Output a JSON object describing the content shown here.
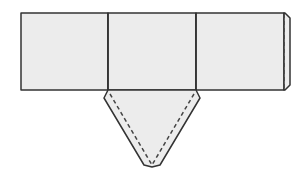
{
  "diagram": {
    "colors": {
      "fill": "#ececec",
      "stroke": "#333333",
      "dashed": "#444444",
      "background": "#ffffff"
    },
    "faces": [
      {
        "name": "face-left",
        "points": "21,13 108,13 108,90 21,90"
      },
      {
        "name": "face-middle",
        "points": "108,13 196,13 196,90 108,90"
      },
      {
        "name": "face-right",
        "points": "196,13 284,13 284,90 196,90"
      }
    ],
    "tabs": [
      {
        "name": "glue-tab-right",
        "points": "284,13 285,13 290,18 290,85 285,90 284,90"
      },
      {
        "name": "triangle-flap-bottom",
        "points": "108,90 196,90 200,98 160,165 152,167 144,165 104,98"
      }
    ],
    "fold_lines": [
      {
        "name": "fold-line-right-tab",
        "x1": 284,
        "y1": 14,
        "x2": 284,
        "y2": 89
      },
      {
        "name": "fold-line-flap-left",
        "x1": 110,
        "y1": 94,
        "x2": 152,
        "y2": 165
      },
      {
        "name": "fold-line-flap-right",
        "x1": 194,
        "y1": 94,
        "x2": 152,
        "y2": 165
      }
    ],
    "solid_lines": [
      {
        "name": "edge-divider-1",
        "x1": 108,
        "y1": 13,
        "x2": 108,
        "y2": 90
      },
      {
        "name": "edge-divider-2",
        "x1": 196,
        "y1": 13,
        "x2": 196,
        "y2": 90
      }
    ]
  }
}
